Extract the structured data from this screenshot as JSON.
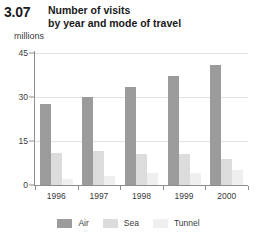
{
  "figure": {
    "number": "3.07",
    "title_line1": "Number of visits",
    "title_line2": "by year and mode of travel",
    "units": "millions"
  },
  "legend": {
    "position": "bottom-center",
    "items": [
      {
        "label": "Air",
        "color": "#9b9b9b",
        "swatch_name": "legend-swatch-air"
      },
      {
        "label": "Sea",
        "color": "#dcdcdc",
        "swatch_name": "legend-swatch-sea"
      },
      {
        "label": "Tunnel",
        "color": "#efefef",
        "swatch_name": "legend-swatch-tunnel"
      }
    ]
  },
  "axes": {
    "y_ticks": [
      "0",
      "15",
      "30",
      "45"
    ],
    "y_tick_values": [
      0,
      15,
      30,
      45
    ],
    "ylim": [
      0,
      45
    ],
    "grid": true,
    "ylabel": "millions",
    "xlabel": ""
  },
  "chart_data": {
    "type": "bar",
    "title": "Number of visits by year and mode of travel",
    "subtitle": "3.07",
    "xlabel": "",
    "ylabel": "millions",
    "ylim": [
      0,
      45
    ],
    "yticks": [
      0,
      15,
      30,
      45
    ],
    "grid": true,
    "legend_position": "bottom-center",
    "categories": [
      "1996",
      "1997",
      "1998",
      "1999",
      "2000"
    ],
    "series": [
      {
        "name": "Air",
        "color": "#9b9b9b",
        "values": [
          27.5,
          30.0,
          33.5,
          37.0,
          41.0
        ]
      },
      {
        "name": "Sea",
        "color": "#dcdcdc",
        "values": [
          11.0,
          11.5,
          10.5,
          10.5,
          9.0
        ]
      },
      {
        "name": "Tunnel",
        "color": "#efefef",
        "values": [
          2.0,
          3.0,
          4.0,
          4.0,
          5.0
        ]
      }
    ]
  }
}
